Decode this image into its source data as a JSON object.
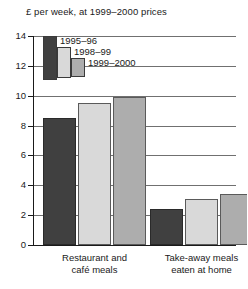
{
  "chart_data": {
    "type": "bar",
    "title": "£ per week, at 1999–2000 prices",
    "xlabel": "",
    "ylabel": "",
    "ylim": [
      0,
      14
    ],
    "ytick_step": 2,
    "yticks": [
      "14",
      "12",
      "10",
      "8",
      "6",
      "4",
      "2",
      "0"
    ],
    "grid": true,
    "legend_position": "top-left-inside",
    "categories": [
      "Restaurant and café meals",
      "Take-away meals eaten at home"
    ],
    "series": [
      {
        "name": "1995–96",
        "color": "#404040",
        "values": [
          8.5,
          2.4
        ]
      },
      {
        "name": "1998–99",
        "color": "#d9d9d9",
        "values": [
          9.5,
          3.1
        ]
      },
      {
        "name": "1999–2000",
        "color": "#adadad",
        "values": [
          9.9,
          3.45
        ]
      }
    ]
  },
  "legend": {
    "items": [
      {
        "label": "1995–96"
      },
      {
        "label": "1998–99"
      },
      {
        "label": "1999–2000"
      }
    ]
  },
  "categories": [
    {
      "line1": "Restaurant and",
      "line2": "café meals"
    },
    {
      "line1": "Take-away meals",
      "line2": "eaten at home"
    }
  ]
}
